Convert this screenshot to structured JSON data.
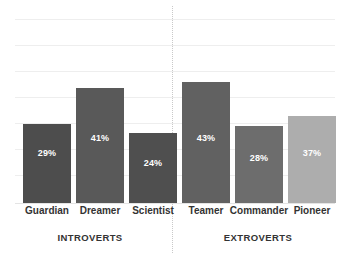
{
  "chart_data": {
    "type": "bar",
    "title": "",
    "subtitle": "",
    "xlabel": "",
    "ylabel": "",
    "ylim": [
      0,
      55
    ],
    "grid": true,
    "gridlines": [
      10,
      20,
      30,
      40,
      50
    ],
    "legend": "none",
    "categories": [
      "Guardian",
      "Dreamer",
      "Scientist",
      "Teamer",
      "Commander",
      "Pioneer"
    ],
    "values": [
      29,
      41,
      24,
      43,
      28,
      37
    ],
    "value_labels": [
      "29%",
      "41%",
      "24%",
      "43%",
      "28%",
      "37%"
    ],
    "bar_colors": [
      "#4d4d4d",
      "#595959",
      "#4f4f4f",
      "#616161",
      "#6d6d6d",
      "#adadad"
    ],
    "groups": [
      {
        "label": "INTROVERTS",
        "categories": [
          "Guardian",
          "Dreamer",
          "Scientist"
        ]
      },
      {
        "label": "EXTROVERTS",
        "categories": [
          "Teamer",
          "Commander",
          "Pioneer"
        ]
      }
    ],
    "group_labels": [
      "INTROVERTS",
      "EXTROVERTS"
    ],
    "value_label_color": "#ffffff",
    "grid_color": "#eeeeee",
    "divider_color": "#c9c9c9",
    "background_color": "#ffffff"
  },
  "bars": [
    {
      "name": "Guardian",
      "value": 29,
      "label": "29%",
      "color": "#4d4d4d",
      "x": 23,
      "width": 48,
      "top": 124,
      "label_y": 148
    },
    {
      "name": "Dreamer",
      "value": 41,
      "label": "41%",
      "color": "#595959",
      "x": 76,
      "width": 48,
      "top": 88,
      "label_y": 133
    },
    {
      "name": "Scientist",
      "value": 24,
      "label": "24%",
      "color": "#4f4f4f",
      "x": 129,
      "width": 48,
      "top": 133,
      "label_y": 158
    },
    {
      "name": "Teamer",
      "value": 43,
      "label": "43%",
      "color": "#616161",
      "x": 182,
      "width": 48,
      "top": 82,
      "label_y": 133
    },
    {
      "name": "Commander",
      "value": 28,
      "label": "28%",
      "color": "#6d6d6d",
      "x": 235,
      "width": 48,
      "top": 126,
      "label_y": 153
    },
    {
      "name": "Pioneer",
      "value": 37,
      "label": "37%",
      "color": "#adadad",
      "x": 288,
      "width": 48,
      "top": 116,
      "label_y": 148
    }
  ],
  "gridlines_y": [
    19,
    45,
    71,
    97,
    123,
    149,
    175
  ],
  "group_positions": [
    {
      "label": "INTROVERTS",
      "center": 90
    },
    {
      "label": "EXTROVERTS",
      "center": 258
    }
  ]
}
